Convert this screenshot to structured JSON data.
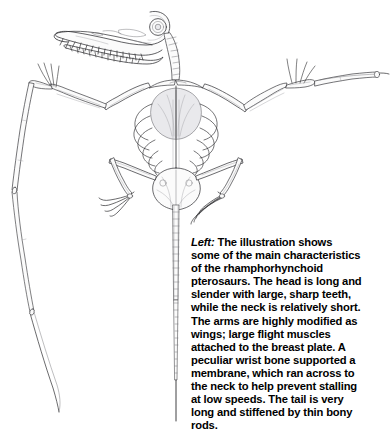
{
  "figure": {
    "illustration_name": "pterosaur-skeleton-front-view",
    "background_color": "#ffffff",
    "ink_color": "#2b2b2e",
    "parts": [
      "skull",
      "upper-jaw-teeth",
      "lower-jaw-teeth",
      "eye-socket",
      "cervical-vertebrae",
      "shoulder-girdle",
      "sternum-breast-plate",
      "ribcage",
      "left-humerus",
      "right-humerus",
      "left-radius-ulna",
      "right-radius-ulna",
      "left-wrist-pteroid",
      "right-wrist-pteroid",
      "left-wing-finger",
      "right-wing-finger",
      "pelvis",
      "left-femur",
      "right-femur",
      "left-tibia",
      "right-tibia",
      "left-foot",
      "right-foot",
      "tail-vertebrae",
      "tail-bony-rods"
    ]
  },
  "caption": {
    "lead_label": "Left:",
    "body": " The illustration shows some of the main characteristics of the rhamphorhynchoid pterosaurs. The head is long and slender with large, sharp teeth, while the neck is relatively short. The arms are highly modified as wings; large flight muscles attached to the breast plate. A peculiar wrist bone supported a membrane, which ran across to the neck to help prevent stalling at low speeds. The tail is very long and stiffened by thin bony rods.",
    "full_text": "Left: The illustration shows some of the main characteristics of the rhamphorhynchoid pterosaurs. The head is long and slender with large, sharp teeth, while the neck is relatively short. The arms are highly modified as wings; large flight muscles attached to the breast plate. A peculiar wrist bone supported a membrane, which ran across to the neck to help prevent stalling at low speeds. The tail is very long and stiffened by thin bony rods.",
    "text_color": "#000000",
    "font_weight": "bold"
  }
}
